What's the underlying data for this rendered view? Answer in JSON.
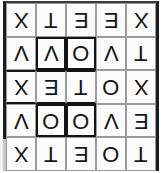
{
  "document": {
    "title": "Rotated Letter Grid",
    "description": "Scanned 5 by 5 grid of capital letters printed upside down",
    "orientation": "rotated-180",
    "rows": 5,
    "columns": 5,
    "colors": {
      "page_background": "#ffffff",
      "cell_background": "#fbfbfb",
      "cell_border": "#9a9a9a",
      "bold_border": "#141414",
      "glyph": "#161616"
    }
  },
  "grid": {
    "rows": [
      {
        "index": 1,
        "cells": [
          {
            "letter": "X",
            "bold": "none"
          },
          {
            "letter": "T",
            "bold": "none"
          },
          {
            "letter": "E",
            "bold": "none"
          },
          {
            "letter": "E",
            "bold": "none"
          },
          {
            "letter": "X",
            "bold": "none"
          }
        ]
      },
      {
        "index": 2,
        "cells": [
          {
            "letter": "V",
            "bold": "none"
          },
          {
            "letter": "V",
            "bold": "all"
          },
          {
            "letter": "O",
            "bold": "all"
          },
          {
            "letter": "V",
            "bold": "none"
          },
          {
            "letter": "T",
            "bold": "none"
          }
        ]
      },
      {
        "index": 3,
        "cells": [
          {
            "letter": "X",
            "bold": "top-bottom"
          },
          {
            "letter": "E",
            "bold": "top-bottom"
          },
          {
            "letter": "T",
            "bold": "top-bottom"
          },
          {
            "letter": "O",
            "bold": "none"
          },
          {
            "letter": "X",
            "bold": "none"
          }
        ]
      },
      {
        "index": 4,
        "cells": [
          {
            "letter": "V",
            "bold": "none"
          },
          {
            "letter": "O",
            "bold": "all"
          },
          {
            "letter": "O",
            "bold": "all"
          },
          {
            "letter": "V",
            "bold": "none"
          },
          {
            "letter": "E",
            "bold": "none"
          }
        ]
      },
      {
        "index": 5,
        "cells": [
          {
            "letter": "X",
            "bold": "none"
          },
          {
            "letter": "T",
            "bold": "none"
          },
          {
            "letter": "E",
            "bold": "none"
          },
          {
            "letter": "O",
            "bold": "none"
          },
          {
            "letter": "T",
            "bold": "none"
          }
        ]
      }
    ]
  },
  "reading": {
    "as_printed_rows": [
      "X T E E X",
      "V V O V T",
      "X E T O X",
      "V O O V E",
      "X T E O T"
    ]
  }
}
